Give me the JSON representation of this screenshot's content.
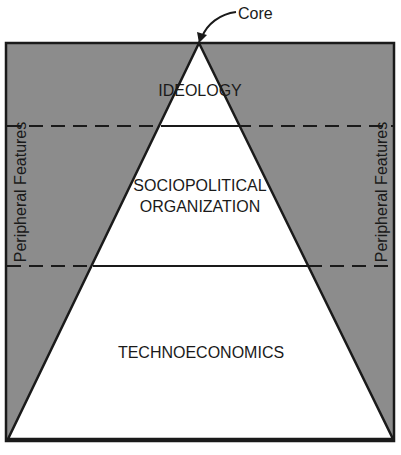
{
  "diagram": {
    "title": "",
    "core_label": "Core",
    "side_labels": {
      "left": "Peripheral Features",
      "right": "Peripheral Features"
    },
    "layers": [
      {
        "id": "ideology",
        "lines": [
          "IDEOLOGY"
        ]
      },
      {
        "id": "sociopolitical",
        "lines": [
          "SOCIOPOLITICAL",
          "ORGANIZATION"
        ]
      },
      {
        "id": "technoeconomics",
        "lines": [
          "TECHNOECONOMICS"
        ]
      }
    ],
    "colors": {
      "periphery_fill": "#8c8c8c",
      "core_fill": "#ffffff",
      "stroke": "#1a1a1a",
      "text": "#1a1a1a"
    },
    "geometry": {
      "box": {
        "x": 6,
        "y": 43,
        "w": 388,
        "h": 398
      },
      "apex": [
        199,
        43
      ],
      "base_left": [
        8,
        439
      ],
      "base_right": [
        393,
        439
      ],
      "divider_y": [
        126,
        266
      ]
    }
  }
}
